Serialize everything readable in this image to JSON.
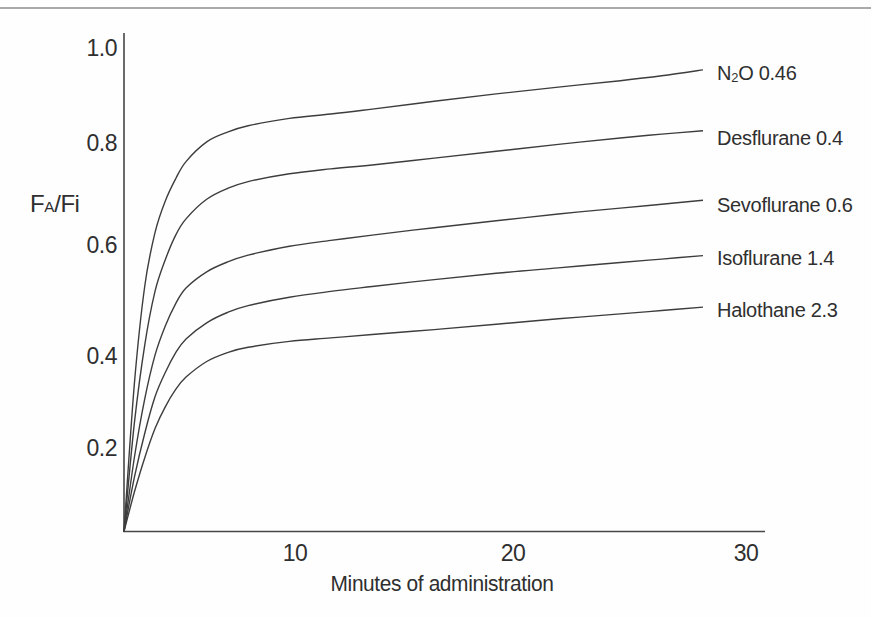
{
  "page": {
    "background": "#fefefe",
    "top_rule_color": "#a9a9a9"
  },
  "chart_data": {
    "type": "line",
    "title": "",
    "xlabel": "Minutes of administration",
    "ylabel": "FA/Fi",
    "ylabel_parts": [
      {
        "t": "F",
        "style": "normal"
      },
      {
        "t": "A",
        "style": "smallsub"
      },
      {
        "t": "/F",
        "style": "normal"
      },
      {
        "t": "i",
        "style": "normal"
      }
    ],
    "xlim": [
      0,
      31
    ],
    "ylim": [
      0,
      1.03
    ],
    "grid": false,
    "legend_position": "right-of-curve-ends",
    "line_color": "#3d3d3d",
    "axis_color": "#474747",
    "text_color": "#2f2f2f",
    "y_ticks": [
      {
        "label": "1.0",
        "value": 1.0,
        "y_px": 48
      },
      {
        "label": "0.8",
        "value": 0.8,
        "y_px": 143
      },
      {
        "label": "0.6",
        "value": 0.6,
        "y_px": 245
      },
      {
        "label": "0.4",
        "value": 0.4,
        "y_px": 356
      },
      {
        "label": "0.2",
        "value": 0.2,
        "y_px": 448
      }
    ],
    "x_ticks": [
      {
        "label": "10",
        "value": 10,
        "x_px": 295
      },
      {
        "label": "20",
        "value": 20,
        "x_px": 513
      },
      {
        "label": "30",
        "value": 30,
        "x_px": 746
      }
    ],
    "plot_layout": {
      "origin_x": 124,
      "origin_y": 531.5,
      "axis_top_y": 33,
      "axis_right_x": 765,
      "x_px_per_min": 20.68,
      "y_px_per_unit": 490,
      "label_left_x": 717,
      "x_tick_center_y": 553,
      "x_title_center_x": 442,
      "x_title_center_y": 584,
      "y_title_left_x": 30,
      "y_title_center_y": 204
    },
    "series": [
      {
        "name": "N2O 0.46",
        "label_parts": [
          {
            "t": "N",
            "style": "normal"
          },
          {
            "t": "2",
            "style": "sub"
          },
          {
            "t": "O 0.46",
            "style": "normal"
          }
        ],
        "label_y_px": 73,
        "points": [
          [
            0,
            0
          ],
          [
            0.5,
            0.3
          ],
          [
            1,
            0.5
          ],
          [
            1.5,
            0.61
          ],
          [
            2,
            0.675
          ],
          [
            2.5,
            0.72
          ],
          [
            3,
            0.755
          ],
          [
            4,
            0.795
          ],
          [
            5,
            0.815
          ],
          [
            6,
            0.828
          ],
          [
            8,
            0.843
          ],
          [
            10,
            0.852
          ],
          [
            12,
            0.862
          ],
          [
            15,
            0.878
          ],
          [
            18,
            0.893
          ],
          [
            21,
            0.907
          ],
          [
            24,
            0.92
          ],
          [
            26,
            0.93
          ],
          [
            28,
            0.942
          ]
        ]
      },
      {
        "name": "Desflurane 0.4",
        "label_parts": [
          {
            "t": "Desflurane 0.4",
            "style": "normal"
          }
        ],
        "label_y_px": 138,
        "points": [
          [
            0,
            0
          ],
          [
            0.5,
            0.22
          ],
          [
            1,
            0.38
          ],
          [
            1.5,
            0.49
          ],
          [
            2,
            0.555
          ],
          [
            2.5,
            0.605
          ],
          [
            3,
            0.638
          ],
          [
            4,
            0.678
          ],
          [
            5,
            0.7
          ],
          [
            6,
            0.714
          ],
          [
            8,
            0.73
          ],
          [
            10,
            0.74
          ],
          [
            12,
            0.748
          ],
          [
            15,
            0.762
          ],
          [
            18,
            0.776
          ],
          [
            21,
            0.79
          ],
          [
            24,
            0.803
          ],
          [
            26,
            0.811
          ],
          [
            28,
            0.818
          ]
        ]
      },
      {
        "name": "Sevoflurane 0.6",
        "label_parts": [
          {
            "t": "Sevoflurane 0.6",
            "style": "normal"
          }
        ],
        "label_y_px": 205,
        "points": [
          [
            0,
            0
          ],
          [
            0.5,
            0.15
          ],
          [
            1,
            0.27
          ],
          [
            1.5,
            0.36
          ],
          [
            2,
            0.42
          ],
          [
            2.5,
            0.465
          ],
          [
            3,
            0.497
          ],
          [
            4,
            0.53
          ],
          [
            5,
            0.55
          ],
          [
            6,
            0.564
          ],
          [
            8,
            0.582
          ],
          [
            10,
            0.594
          ],
          [
            12,
            0.605
          ],
          [
            15,
            0.62
          ],
          [
            18,
            0.634
          ],
          [
            21,
            0.648
          ],
          [
            24,
            0.66
          ],
          [
            26,
            0.668
          ],
          [
            28,
            0.676
          ]
        ]
      },
      {
        "name": "Isoflurane 1.4",
        "label_parts": [
          {
            "t": "Isoflurane 1.4",
            "style": "normal"
          }
        ],
        "label_y_px": 258,
        "points": [
          [
            0,
            0
          ],
          [
            0.5,
            0.11
          ],
          [
            1,
            0.2
          ],
          [
            1.5,
            0.275
          ],
          [
            2,
            0.325
          ],
          [
            2.5,
            0.365
          ],
          [
            3,
            0.393
          ],
          [
            4,
            0.426
          ],
          [
            5,
            0.447
          ],
          [
            6,
            0.461
          ],
          [
            8,
            0.478
          ],
          [
            10,
            0.49
          ],
          [
            12,
            0.5
          ],
          [
            15,
            0.514
          ],
          [
            18,
            0.527
          ],
          [
            21,
            0.538
          ],
          [
            24,
            0.549
          ],
          [
            26,
            0.556
          ],
          [
            28,
            0.563
          ]
        ]
      },
      {
        "name": "Halothane 2.3",
        "label_parts": [
          {
            "t": "Halothane 2.3",
            "style": "normal"
          }
        ],
        "label_y_px": 310,
        "points": [
          [
            0,
            0
          ],
          [
            0.5,
            0.08
          ],
          [
            1,
            0.15
          ],
          [
            1.5,
            0.21
          ],
          [
            2,
            0.255
          ],
          [
            2.5,
            0.29
          ],
          [
            3,
            0.315
          ],
          [
            4,
            0.347
          ],
          [
            5,
            0.365
          ],
          [
            6,
            0.376
          ],
          [
            8,
            0.388
          ],
          [
            10,
            0.395
          ],
          [
            12,
            0.402
          ],
          [
            15,
            0.412
          ],
          [
            18,
            0.423
          ],
          [
            21,
            0.434
          ],
          [
            24,
            0.444
          ],
          [
            26,
            0.451
          ],
          [
            28,
            0.458
          ]
        ]
      }
    ]
  }
}
